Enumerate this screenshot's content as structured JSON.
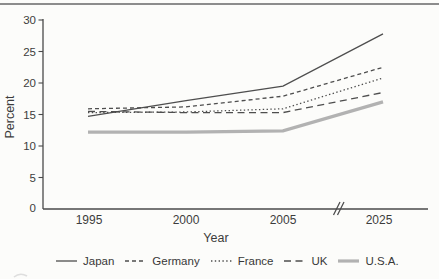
{
  "page": {
    "background": "#fcfcfa",
    "top_rule_color": "#8c8c8c",
    "axis_color": "#4a4a4a",
    "text_color": "#3c3c3c"
  },
  "chart_data": {
    "type": "line",
    "title": "",
    "xlabel": "Year",
    "ylabel": "Percent",
    "x_categories": [
      "1995",
      "2000",
      "2005",
      "2025"
    ],
    "x_axis_break_between": [
      "2005",
      "2025"
    ],
    "ylim": [
      0,
      30
    ],
    "ytick_labels": [
      "30",
      "25",
      "20",
      "15",
      "10",
      "5",
      "0"
    ],
    "yticks": [
      30,
      25,
      20,
      15,
      10,
      5,
      0
    ],
    "grid": false,
    "legend_position": "bottom",
    "series": [
      {
        "name": "Japan",
        "style": "solid",
        "color": "#4e4e4e",
        "width": 1.3,
        "values": [
          14.7,
          17.2,
          19.5,
          27.8
        ]
      },
      {
        "name": "Germany",
        "style": "dashed",
        "color": "#4e4e4e",
        "width": 1.3,
        "values": [
          15.9,
          16.2,
          17.9,
          22.5
        ]
      },
      {
        "name": "France",
        "style": "dotted",
        "color": "#4e4e4e",
        "width": 1.3,
        "values": [
          15.3,
          15.4,
          15.9,
          20.8
        ]
      },
      {
        "name": "UK",
        "style": "longdash",
        "color": "#4e4e4e",
        "width": 1.3,
        "values": [
          15.5,
          15.3,
          15.3,
          18.5
        ]
      },
      {
        "name": "U.S.A.",
        "style": "solid-thick",
        "color": "#b2b2b2",
        "width": 3.2,
        "values": [
          12.2,
          12.2,
          12.4,
          17.0
        ]
      }
    ]
  }
}
